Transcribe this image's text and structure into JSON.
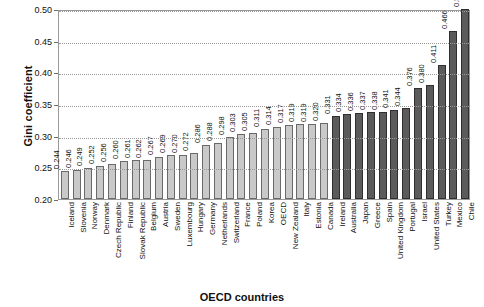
{
  "chart_data": {
    "type": "bar",
    "title": "",
    "xlabel": "OECD countries",
    "ylabel": "Gini coefficient",
    "ylim": [
      0.2,
      0.5
    ],
    "ytick_labels": [
      "0.20",
      "0.25",
      "0.30",
      "0.35",
      "0.40",
      "0.45",
      "0.50"
    ],
    "ytick_values": [
      0.2,
      0.25,
      0.3,
      0.35,
      0.4,
      0.45,
      0.5
    ],
    "grid": true,
    "legend": "none",
    "categories": [
      "Iceland",
      "Slovenia",
      "Norway",
      "Denmark",
      "Czech Republic",
      "Finland",
      "Slovak Republic",
      "Belgium",
      "Austria",
      "Sweden",
      "Luxembourg",
      "Hungary",
      "Germany",
      "Netherlands",
      "Switzerland",
      "France",
      "Poland",
      "Korea",
      "OECD",
      "New Zealand",
      "Italy",
      "Estonia",
      "Canada",
      "Ireland",
      "Australia",
      "Japan",
      "Greece",
      "Spain",
      "United Kingdom",
      "Portugal",
      "Israel",
      "United States",
      "Turkey",
      "Mexico",
      "Chile"
    ],
    "values": [
      0.244,
      0.246,
      0.249,
      0.252,
      0.256,
      0.26,
      0.261,
      0.262,
      0.267,
      0.269,
      0.27,
      0.272,
      0.286,
      0.288,
      0.298,
      0.303,
      0.305,
      0.311,
      0.314,
      0.317,
      0.319,
      0.319,
      0.32,
      0.331,
      0.334,
      0.336,
      0.337,
      0.338,
      0.341,
      0.344,
      0.376,
      0.38,
      0.411,
      0.466,
      0.5
    ],
    "value_labels": [
      "0.244",
      "0.246",
      "0.249",
      "0.252",
      "0.256",
      "0.260",
      "0.261",
      "0.262",
      "0.267",
      "0.269",
      "0.270",
      "0.272",
      "0.286",
      "0.288",
      "0.298",
      "0.303",
      "0.305",
      "0.311",
      "0.314",
      "0.317",
      "0.319",
      "0.319",
      "0.320",
      "0.331",
      "0.334",
      "0.336",
      "0.337",
      "0.338",
      "0.341",
      "0.344",
      "0.376",
      "0.380",
      "0.411",
      "0.466",
      "0.500"
    ],
    "bar_shades": [
      "light",
      "light",
      "light",
      "light",
      "light",
      "light",
      "light",
      "light",
      "light",
      "light",
      "light",
      "light",
      "light",
      "light",
      "light",
      "light",
      "light",
      "light",
      "light",
      "light",
      "light",
      "light",
      "light",
      "dark",
      "dark",
      "dark",
      "dark",
      "dark",
      "dark",
      "dark",
      "dark",
      "dark",
      "dark",
      "dark",
      "dark"
    ],
    "colors": {
      "bar_light": "#c9c9c9",
      "bar_dark": "#5b5b5b",
      "bar_light_border": "#6a6a6a",
      "bar_dark_border": "#2f2f2f",
      "axis": "#9a9a9a",
      "text": "#111111"
    }
  }
}
